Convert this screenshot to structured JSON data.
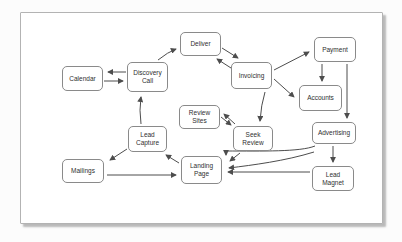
{
  "diagram": {
    "nodes": {
      "calendar": "Calendar",
      "discovery_call": "Discovery Call",
      "deliver": "Deliver",
      "invoicing": "Invoicing",
      "payment": "Payment",
      "accounts": "Accounts",
      "review_sites": "Review Sites",
      "seek_review": "Seek Review",
      "advertising": "Advertising",
      "lead_capture": "Lead Capture",
      "landing_page": "Landing Page",
      "mailings": "Mailings",
      "lead_magnet": "Lead Magnet"
    },
    "edges": [
      {
        "from": "Discovery Call",
        "to": "Calendar"
      },
      {
        "from": "Calendar",
        "to": "Discovery Call"
      },
      {
        "from": "Discovery Call",
        "to": "Deliver"
      },
      {
        "from": "Deliver",
        "to": "Invoicing"
      },
      {
        "from": "Invoicing",
        "to": "Deliver"
      },
      {
        "from": "Invoicing",
        "to": "Payment"
      },
      {
        "from": "Invoicing",
        "to": "Accounts"
      },
      {
        "from": "Payment",
        "to": "Accounts"
      },
      {
        "from": "Payment",
        "to": "Advertising"
      },
      {
        "from": "Invoicing",
        "to": "Seek Review"
      },
      {
        "from": "Seek Review",
        "to": "Review Sites"
      },
      {
        "from": "Review Sites",
        "to": "Seek Review"
      },
      {
        "from": "Advertising",
        "to": "Lead Magnet"
      },
      {
        "from": "Lead Magnet",
        "to": "Landing Page"
      },
      {
        "from": "Advertising",
        "to": "Landing Page"
      },
      {
        "from": "Advertising",
        "to": "Landing Page"
      },
      {
        "from": "Seek Review",
        "to": "Landing Page"
      },
      {
        "from": "Landing Page",
        "to": "Lead Capture"
      },
      {
        "from": "Lead Capture",
        "to": "Discovery Call"
      },
      {
        "from": "Lead Capture",
        "to": "Mailings"
      },
      {
        "from": "Mailings",
        "to": "Landing Page"
      }
    ],
    "colors": {
      "box_border": "#8a8a8a",
      "box_fill": "#ffffff",
      "text": "#2f2f2f",
      "arrow": "#4d4d4d",
      "card_border": "#b3b3b3",
      "card_shadow": "#828282"
    }
  }
}
